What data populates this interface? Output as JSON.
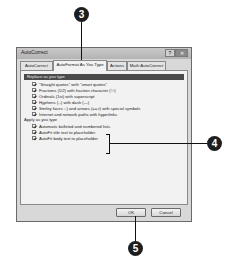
{
  "dialog": {
    "title": "AutoCorrect",
    "help_glyph": "?",
    "close_glyph": "✕",
    "tabs": [
      {
        "label": "AutoCorrect",
        "active": false
      },
      {
        "label": "AutoFormat As You Type",
        "active": true
      },
      {
        "label": "Actions",
        "active": false
      },
      {
        "label": "Math AutoCorrect",
        "active": false
      }
    ],
    "replace_group": {
      "header": "Replace as you type",
      "items": [
        {
          "label": "\"Straight quotes\" with \"smart quotes\"",
          "checked": true
        },
        {
          "label": "Fractions (1/2) with fraction character (½)",
          "checked": true
        },
        {
          "label": "Ordinals (1st) with superscript",
          "checked": true
        },
        {
          "label": "Hyphens (--) with dash (—)",
          "checked": true
        },
        {
          "label": "Smiley faces :-) and arrows (==>) with special symbols",
          "checked": true
        },
        {
          "label": "Internet and network paths with hyperlinks",
          "checked": true
        }
      ]
    },
    "apply_group": {
      "header": "Apply as you type",
      "items": [
        {
          "label": "Automatic bulleted and numbered lists",
          "checked": true
        },
        {
          "label": "AutoFit title text to placeholder",
          "checked": true
        },
        {
          "label": "AutoFit body text to placeholder",
          "checked": true
        }
      ]
    },
    "buttons": {
      "ok": "OK",
      "cancel": "Cancel"
    }
  },
  "callouts": {
    "three": "3",
    "four": "4",
    "five": "5"
  }
}
